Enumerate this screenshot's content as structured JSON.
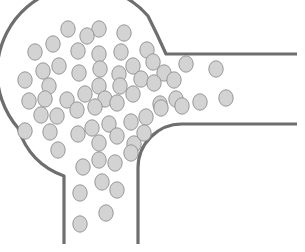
{
  "diagram": {
    "kind": "particle-flow-junction",
    "colors": {
      "background": "#ffffff",
      "wall": "#6e6e6e",
      "particle_fill": "#d3d3d3",
      "particle_stroke": "#8f8f8f"
    },
    "walls": [
      {
        "name": "outer-wall",
        "path": "M 64 244 L 64 178 Q 40 170 28 146 A 68 68 0 1 1 162 60 L 178 59 Q 180 55 172 52 M 163 56 L 297 56"
      },
      {
        "name": "chamber-arc",
        "path": "M 64 244 L 64 178 Q 26 162 17 128 A 70 70 0 0 1 147 18 Q 158 36 166 54 L 297 54"
      },
      {
        "name": "inner-corner-wall",
        "path": "M 138 244 L 138 170 A 46 46 0 0 1 184 124 L 297 124"
      }
    ],
    "particle_radius": {
      "rx": 7.2,
      "ry": 8.2
    },
    "particles": [
      [
        68,
        29
      ],
      [
        99,
        29
      ],
      [
        124,
        33
      ],
      [
        87,
        36
      ],
      [
        53,
        44
      ],
      [
        35,
        52
      ],
      [
        78,
        51
      ],
      [
        99,
        54
      ],
      [
        121,
        52
      ],
      [
        147,
        50
      ],
      [
        43,
        71
      ],
      [
        59,
        66
      ],
      [
        79,
        73
      ],
      [
        100,
        69
      ],
      [
        119,
        74
      ],
      [
        133,
        66
      ],
      [
        153,
        62
      ],
      [
        164,
        73
      ],
      [
        186,
        64
      ],
      [
        25,
        80
      ],
      [
        49,
        86
      ],
      [
        99,
        86
      ],
      [
        120,
        86
      ],
      [
        141,
        79
      ],
      [
        174,
        80
      ],
      [
        216,
        69
      ],
      [
        29,
        101
      ],
      [
        45,
        99
      ],
      [
        67,
        100
      ],
      [
        85,
        94
      ],
      [
        105,
        99
      ],
      [
        133,
        94
      ],
      [
        154,
        83
      ],
      [
        176,
        99
      ],
      [
        200,
        102
      ],
      [
        226,
        98
      ],
      [
        41,
        115
      ],
      [
        57,
        116
      ],
      [
        77,
        110
      ],
      [
        95,
        107
      ],
      [
        117,
        103
      ],
      [
        160,
        104
      ],
      [
        182,
        106
      ],
      [
        25,
        131
      ],
      [
        50,
        132
      ],
      [
        78,
        134
      ],
      [
        92,
        128
      ],
      [
        109,
        124
      ],
      [
        131,
        122
      ],
      [
        146,
        117
      ],
      [
        161,
        108
      ],
      [
        58,
        150
      ],
      [
        99,
        143
      ],
      [
        117,
        136
      ],
      [
        134,
        144
      ],
      [
        144,
        133
      ],
      [
        83,
        167
      ],
      [
        99,
        160
      ],
      [
        115,
        163
      ],
      [
        131,
        153
      ],
      [
        80,
        193
      ],
      [
        102,
        182
      ],
      [
        117,
        190
      ],
      [
        106,
        213
      ],
      [
        80,
        224
      ]
    ]
  }
}
